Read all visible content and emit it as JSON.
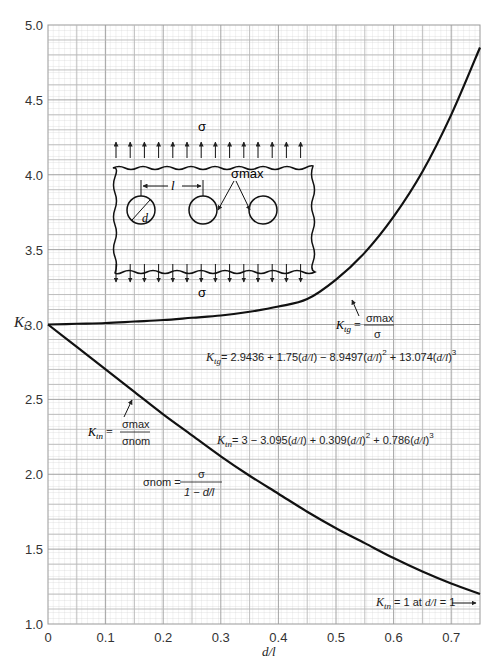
{
  "chart_data": {
    "type": "line",
    "title": "",
    "xlabel": "d/l",
    "ylabel": "K_t",
    "xlim": [
      0,
      0.75
    ],
    "ylim": [
      1.0,
      5.0
    ],
    "grid": true,
    "x_ticks": [
      "0",
      "0.1",
      "0.2",
      "0.3",
      "0.4",
      "0.5",
      "0.6",
      "0.7"
    ],
    "y_ticks": [
      "1.0",
      "1.5",
      "2.0",
      "2.5",
      "3.0",
      "3.5",
      "4.0",
      "4.5",
      "5.0"
    ],
    "x": [
      0,
      0.05,
      0.1,
      0.15,
      0.2,
      0.25,
      0.3,
      0.35,
      0.4,
      0.45,
      0.5,
      0.55,
      0.6,
      0.65,
      0.7,
      0.75
    ],
    "series": [
      {
        "name": "K_tg",
        "values": [
          3.0,
          3.005,
          3.01,
          3.02,
          3.03,
          3.045,
          3.06,
          3.085,
          3.12,
          3.17,
          3.3,
          3.48,
          3.72,
          4.02,
          4.4,
          4.85
        ]
      },
      {
        "name": "K_tn",
        "values": [
          3.0,
          2.85,
          2.7,
          2.55,
          2.4,
          2.26,
          2.12,
          1.99,
          1.87,
          1.75,
          1.64,
          1.54,
          1.44,
          1.35,
          1.27,
          1.2
        ]
      }
    ],
    "annotations": {
      "ktg_def": {
        "lhs": "K_tg =",
        "num": "σmax",
        "den": "σ"
      },
      "ktg_eq": "K_tg = 2.9436 + 1.75(d/l) − 8.9497(d/l)^2 + 13.074(d/l)^3",
      "ktn_def": {
        "lhs": "K_tn =",
        "num": "σmax",
        "den": "σnom"
      },
      "ktn_eq": "K_tn = 3 − 3.095(d/l) + 0.309(d/l)^2 + 0.786(d/l)^3",
      "snom_def": {
        "lhs": "σnom =",
        "num": "σ",
        "den": "1 − d/l"
      },
      "ktn_limit": "K_tn = 1 at d/l = 1",
      "inset": {
        "sigma_top": "σ",
        "sigma_bottom": "σ",
        "sigma_max": "σmax",
        "dim_l": "l",
        "dim_d": "d"
      }
    }
  }
}
